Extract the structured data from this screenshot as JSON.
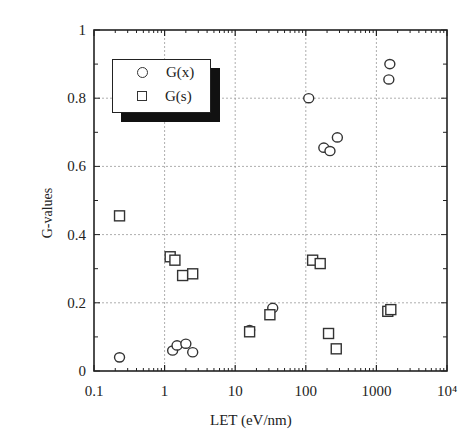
{
  "chart_data": {
    "type": "scatter",
    "title": "",
    "xlabel": "LET (eV/nm)",
    "ylabel": "G-values",
    "xscale": "log",
    "xlim": [
      0.1,
      10000
    ],
    "ylim": [
      0,
      1
    ],
    "x_tick_labels": [
      "0.1",
      "1",
      "10",
      "100",
      "1000",
      "10⁴"
    ],
    "y_tick_labels": [
      "0",
      "0.2",
      "0.4",
      "0.6",
      "0.8",
      "1"
    ],
    "grid": true,
    "legend_position": "upper left",
    "series": [
      {
        "name": "G(x)",
        "marker": "circle",
        "points": [
          {
            "x": 0.23,
            "y": 0.04
          },
          {
            "x": 1.3,
            "y": 0.06
          },
          {
            "x": 1.5,
            "y": 0.075
          },
          {
            "x": 2.0,
            "y": 0.08
          },
          {
            "x": 2.5,
            "y": 0.055
          },
          {
            "x": 16,
            "y": 0.12
          },
          {
            "x": 34,
            "y": 0.185
          },
          {
            "x": 110,
            "y": 0.8
          },
          {
            "x": 180,
            "y": 0.655
          },
          {
            "x": 220,
            "y": 0.645
          },
          {
            "x": 280,
            "y": 0.685
          },
          {
            "x": 1500,
            "y": 0.855
          },
          {
            "x": 1550,
            "y": 0.9
          }
        ]
      },
      {
        "name": "G(s)",
        "marker": "square",
        "points": [
          {
            "x": 0.23,
            "y": 0.455
          },
          {
            "x": 1.2,
            "y": 0.335
          },
          {
            "x": 1.4,
            "y": 0.325
          },
          {
            "x": 1.8,
            "y": 0.28
          },
          {
            "x": 2.5,
            "y": 0.285
          },
          {
            "x": 16,
            "y": 0.115
          },
          {
            "x": 31,
            "y": 0.165
          },
          {
            "x": 125,
            "y": 0.325
          },
          {
            "x": 160,
            "y": 0.315
          },
          {
            "x": 210,
            "y": 0.11
          },
          {
            "x": 270,
            "y": 0.065
          },
          {
            "x": 1450,
            "y": 0.175
          },
          {
            "x": 1600,
            "y": 0.18
          }
        ]
      }
    ]
  },
  "legend": {
    "items": [
      {
        "label": "G(x)"
      },
      {
        "label": "G(s)"
      }
    ]
  },
  "axes": {
    "xlabel": "LET (eV/nm)",
    "ylabel": "G-values"
  }
}
